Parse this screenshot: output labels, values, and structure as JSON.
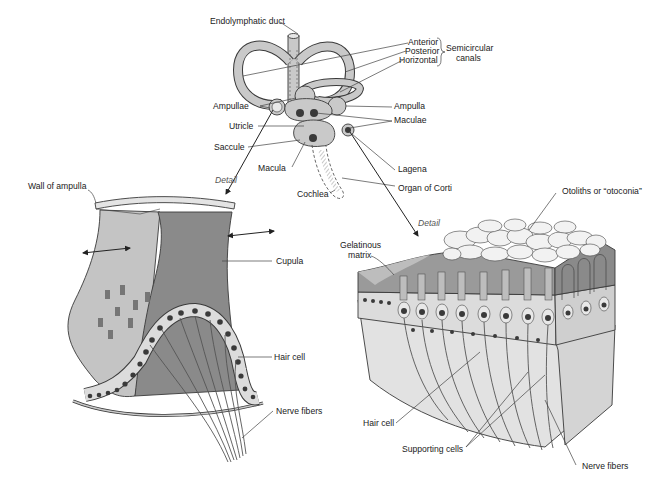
{
  "diagram": {
    "top_figure": {
      "labels": {
        "endolymphatic_duct": "Endolymphatic duct",
        "anterior": "Anterior",
        "posterior": "Posterior",
        "horizontal": "Horizontal",
        "semicircular_line1": "Semicircular",
        "semicircular_line2": "canals",
        "ampullae": "Ampullae",
        "ampulla": "Ampulla",
        "utricle": "Utricle",
        "maculae": "Maculae",
        "saccule": "Saccule",
        "macula": "Macula",
        "lagena": "Lagena",
        "organ_of_corti": "Organ of Corti",
        "cochlea": "Cochlea",
        "detail_left": "Detail",
        "detail_right": "Detail"
      }
    },
    "left_figure": {
      "name": "Crista ampullaris",
      "labels": {
        "wall_of_ampulla": "Wall of ampulla",
        "cupula": "Cupula",
        "hair_cell": "Hair cell",
        "nerve_fibers": "Nerve fibers"
      }
    },
    "right_figure": {
      "name": "Macula",
      "labels": {
        "otoliths": "Otoliths or “otoconia”",
        "gelatinous_line1": "Gelatinous",
        "gelatinous_line2": "matrix",
        "hair_cell": "Hair cell",
        "supporting_cells": "Supporting cells",
        "nerve_fibers": "Nerve fibers"
      }
    },
    "colors": {
      "labyrinth_fill": "#c9c9c9",
      "cupula_dark": "#8a8a8a",
      "cupula_light": "#c4c4c4",
      "gel_matrix": "#9a9a9a",
      "cell_fill": "#dcdcdc",
      "nucleus": "#3a3a3a",
      "otolith": "#f2f2f2",
      "base_tissue": "#e2e2e2"
    }
  }
}
